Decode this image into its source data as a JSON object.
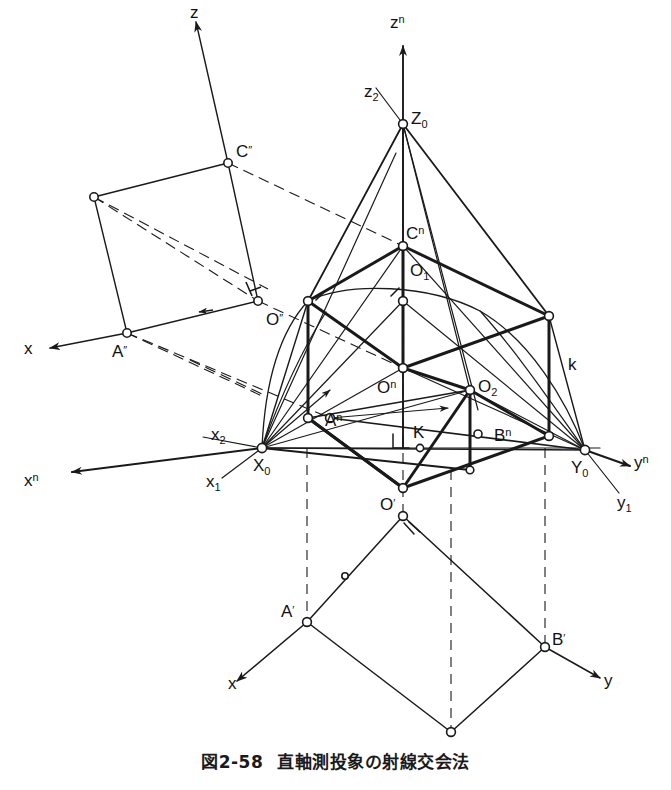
{
  "figure": {
    "caption_number": "図2-58",
    "caption_text": "直軸測投象の射線交会法",
    "line_color": "#1a1a1a",
    "background_color": "#ffffff",
    "node_fill": "#ffffff"
  },
  "labels": {
    "z_front": "z",
    "c_front": "C",
    "c_front_prime": "″",
    "o_front": "O",
    "o_front_prime": "″",
    "a_front": "A",
    "a_front_prime": "″",
    "x_front": "x",
    "zn": "z",
    "zn_sup": "n",
    "z2": "z",
    "z2_sub": "2",
    "Z0": "Z",
    "Z0_sub": "0",
    "Cn": "C",
    "Cn_sup": "n",
    "O1": "O",
    "O1_sub": "1",
    "On": "O",
    "On_sup": "n",
    "O2": "O",
    "O2_sub": "2",
    "An": "A",
    "An_sup": "n",
    "Bn": "B",
    "Bn_sup": "n",
    "K": "K",
    "k_curve": "k",
    "x2": "x",
    "x2_sub": "2",
    "xn": "x",
    "xn_sup": "n",
    "x1": "x",
    "x1_sub": "1",
    "X0": "X",
    "X0_sub": "0",
    "Y0": "Y",
    "Y0_sub": "0",
    "yn": "y",
    "yn_sup": "n",
    "y1": "y",
    "y1_sub": "1",
    "O_plan": "O",
    "O_plan_prime": "′",
    "A_plan": "A",
    "A_plan_prime": "′",
    "B_plan": "B",
    "B_plan_prime": "′",
    "x_plan": "x",
    "y_plan": "y"
  }
}
